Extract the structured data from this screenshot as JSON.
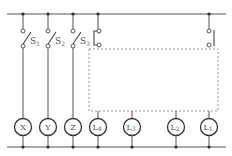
{
  "diagram": {
    "type": "circuit",
    "switches": [
      {
        "id": "S1",
        "letter": "S",
        "sub": "1",
        "x": 23
      },
      {
        "id": "S2",
        "letter": "S",
        "sub": "2",
        "x": 48
      },
      {
        "id": "S3",
        "letter": "S",
        "sub": "3",
        "x": 73
      },
      {
        "id": "S4",
        "letter": "",
        "sub": "",
        "x": 98,
        "style": "box-connected"
      },
      {
        "id": "S5",
        "letter": "",
        "sub": "",
        "x": 209,
        "style": "box-connected"
      }
    ],
    "lamps": [
      {
        "id": "X",
        "letter": "X",
        "sub": "",
        "x": 23
      },
      {
        "id": "Y",
        "letter": "Y",
        "sub": "",
        "x": 48
      },
      {
        "id": "Z",
        "letter": "Z",
        "sub": "",
        "x": 73
      },
      {
        "id": "L4",
        "letter": "L",
        "sub": "4",
        "x": 98
      },
      {
        "id": "L3",
        "letter": "L",
        "sub": "3",
        "x": 132
      },
      {
        "id": "L2",
        "letter": "L",
        "sub": "2",
        "x": 176
      },
      {
        "id": "L1",
        "letter": "L",
        "sub": "1",
        "x": 209
      }
    ],
    "hidden_region": {
      "label": "",
      "style": "dashed box"
    }
  }
}
